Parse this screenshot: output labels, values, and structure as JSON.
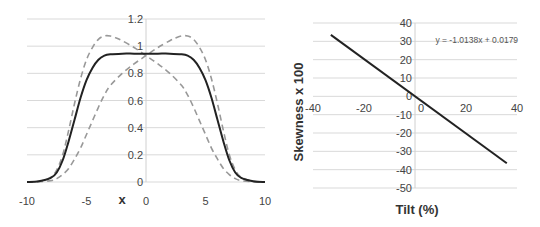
{
  "chart_data": [
    {
      "type": "line",
      "title": "",
      "xlabel": "x",
      "ylabel": "",
      "xlim": [
        -10,
        10
      ],
      "ylim": [
        0,
        1.2
      ],
      "grid": true,
      "x_ticks": [
        "-10",
        "-5",
        "0",
        "5",
        "10"
      ],
      "y_ticks": [
        "0",
        "0.2",
        "0.4",
        "0.6",
        "0.8",
        "1",
        "1.2"
      ],
      "x_tick_values": [
        -10,
        -5,
        0,
        5,
        10
      ],
      "y_tick_values": [
        0,
        0.2,
        0.4,
        0.6,
        0.8,
        1,
        1.2
      ],
      "series": [
        {
          "name": "symmetric",
          "style": "solid",
          "color": "#222222",
          "x": [
            -10,
            -9,
            -8,
            -7.5,
            -7,
            -6.5,
            -6,
            -5.5,
            -5,
            -4.5,
            -4,
            -3.5,
            -3,
            -2,
            -1,
            0,
            1,
            2,
            3,
            3.5,
            4,
            4.5,
            5,
            5.5,
            6,
            6.5,
            7,
            7.5,
            8,
            9,
            10
          ],
          "y": [
            0,
            0.005,
            0.03,
            0.07,
            0.16,
            0.3,
            0.46,
            0.62,
            0.75,
            0.84,
            0.9,
            0.93,
            0.94,
            0.945,
            0.945,
            0.945,
            0.945,
            0.945,
            0.94,
            0.93,
            0.9,
            0.84,
            0.75,
            0.62,
            0.46,
            0.3,
            0.16,
            0.07,
            0.03,
            0.005,
            0
          ]
        },
        {
          "name": "tilted-left",
          "style": "dashed",
          "color": "#999999",
          "x": [
            -10,
            -9,
            -8,
            -7.5,
            -7,
            -6.5,
            -6,
            -5.5,
            -5,
            -4.5,
            -4,
            -3.5,
            -3,
            -2.5,
            -2,
            -1,
            0,
            1,
            2,
            3,
            3.5,
            4,
            4.5,
            5,
            5.5,
            6,
            6.5,
            7,
            7.5,
            8,
            9,
            10
          ],
          "y": [
            0,
            0.005,
            0.035,
            0.09,
            0.2,
            0.38,
            0.58,
            0.76,
            0.9,
            0.99,
            1.05,
            1.075,
            1.075,
            1.06,
            1.04,
            0.99,
            0.93,
            0.87,
            0.8,
            0.71,
            0.64,
            0.55,
            0.45,
            0.35,
            0.25,
            0.17,
            0.1,
            0.055,
            0.025,
            0.01,
            0.002,
            0
          ]
        },
        {
          "name": "tilted-right",
          "style": "dashed",
          "color": "#999999",
          "x": [
            -10,
            -9,
            -8,
            -7.5,
            -7,
            -6.5,
            -6,
            -5.5,
            -5,
            -4.5,
            -4,
            -3.5,
            -3,
            -2,
            -1,
            0,
            1,
            2,
            2.5,
            3,
            3.5,
            4,
            4.5,
            5,
            5.5,
            6,
            6.5,
            7,
            7.5,
            8,
            9,
            10
          ],
          "y": [
            0,
            0.002,
            0.01,
            0.025,
            0.055,
            0.1,
            0.17,
            0.25,
            0.35,
            0.45,
            0.55,
            0.64,
            0.71,
            0.8,
            0.87,
            0.93,
            0.99,
            1.04,
            1.06,
            1.075,
            1.075,
            1.05,
            0.99,
            0.9,
            0.76,
            0.58,
            0.38,
            0.2,
            0.09,
            0.035,
            0.005,
            0
          ]
        }
      ]
    },
    {
      "type": "line",
      "title": "",
      "xlabel": "Tilt (%)",
      "ylabel": "Skewness x 100",
      "xlim": [
        -40,
        40
      ],
      "ylim": [
        -50,
        40
      ],
      "grid": true,
      "x_ticks": [
        "-40",
        "-20",
        "0",
        "20",
        "40"
      ],
      "y_ticks": [
        "40",
        "30",
        "20",
        "10",
        "0",
        "-10",
        "-20",
        "-30",
        "-40",
        "-50"
      ],
      "x_tick_values": [
        -40,
        -20,
        0,
        20,
        40
      ],
      "y_tick_values": [
        40,
        30,
        20,
        10,
        0,
        -10,
        -20,
        -30,
        -40,
        -50
      ],
      "annotation": "y = -1.0138x + 0.0179",
      "series": [
        {
          "name": "linear fit",
          "style": "solid",
          "color": "#222222",
          "x": [
            -33,
            36
          ],
          "y": [
            33.5,
            -36.5
          ]
        }
      ]
    }
  ]
}
